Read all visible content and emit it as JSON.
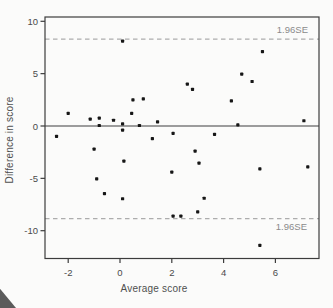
{
  "colors": {
    "background": "#fbfbfa",
    "point": "#161616",
    "frame": "#3c3c3c",
    "tick_text": "#4a4a4a",
    "axis_label_text": "#4f4f4f",
    "zero_line": "#7d7d7d",
    "dashed_line": "#adadad",
    "se_label_text": "#8a8a8a"
  },
  "chart_data": {
    "type": "scatter",
    "title": "",
    "xlabel": "Average score",
    "ylabel": "Difference in score",
    "xlim": [
      -2.9,
      7.7
    ],
    "ylim": [
      -12.7,
      10.4
    ],
    "x_ticks": [
      -2,
      0,
      2,
      4,
      6
    ],
    "y_ticks": [
      -10,
      -5,
      0,
      5,
      10
    ],
    "grid": false,
    "legend": "none",
    "mean_line": 0,
    "limit_lines": [
      {
        "value": 8.3,
        "label": "1.96SE",
        "style": "dashed"
      },
      {
        "value": -8.85,
        "label": "1.96SE",
        "style": "dashed"
      }
    ],
    "points": [
      [
        0.1,
        8.1
      ],
      [
        5.5,
        7.1
      ],
      [
        4.7,
        4.95
      ],
      [
        5.1,
        4.25
      ],
      [
        2.6,
        4.0
      ],
      [
        2.8,
        3.5
      ],
      [
        4.3,
        2.4
      ],
      [
        0.5,
        2.5
      ],
      [
        0.9,
        2.6
      ],
      [
        -2.0,
        1.2
      ],
      [
        0.45,
        1.2
      ],
      [
        -1.15,
        0.65
      ],
      [
        -0.8,
        0.75
      ],
      [
        -0.25,
        0.55
      ],
      [
        0.1,
        0.2
      ],
      [
        0.75,
        0.05
      ],
      [
        1.45,
        0.4
      ],
      [
        7.1,
        0.5
      ],
      [
        -0.8,
        0.05
      ],
      [
        0.1,
        -0.4
      ],
      [
        4.55,
        0.1
      ],
      [
        3.65,
        -0.8
      ],
      [
        2.05,
        -0.7
      ],
      [
        1.25,
        -1.2
      ],
      [
        -2.45,
        -1.0
      ],
      [
        -1.0,
        -2.2
      ],
      [
        2.9,
        -2.4
      ],
      [
        0.15,
        -3.35
      ],
      [
        3.05,
        -3.55
      ],
      [
        5.4,
        -4.1
      ],
      [
        7.25,
        -3.9
      ],
      [
        2.0,
        -4.4
      ],
      [
        -0.9,
        -5.05
      ],
      [
        -0.6,
        -6.45
      ],
      [
        3.25,
        -6.9
      ],
      [
        0.1,
        -6.95
      ],
      [
        2.05,
        -8.6
      ],
      [
        2.35,
        -8.6
      ],
      [
        3.0,
        -8.2
      ],
      [
        5.4,
        -11.4
      ]
    ]
  }
}
